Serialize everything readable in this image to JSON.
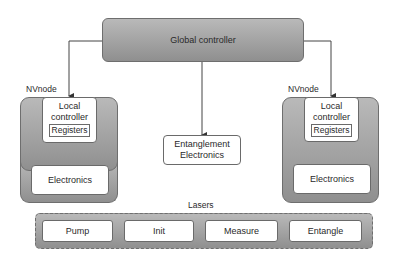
{
  "diagram": {
    "global_controller": {
      "label": "Global controller"
    },
    "nodes": [
      {
        "title": "NVnode",
        "local_controller": "Local\ncontroller",
        "local_controller_line1": "Local",
        "local_controller_line2": "controller",
        "registers": "Registers",
        "electronics": "Electronics"
      },
      {
        "title": "NVnode",
        "local_controller": "Local\ncontroller",
        "local_controller_line1": "Local",
        "local_controller_line2": "controller",
        "registers": "Registers",
        "electronics": "Electronics"
      }
    ],
    "entanglement_electronics": {
      "line1": "Entanglement",
      "line2": "Electronics"
    },
    "lasers": {
      "title": "Lasers",
      "items": [
        "Pump",
        "Init",
        "Measure",
        "Entangle"
      ]
    },
    "colors": {
      "container_fill_top": "#b9b9b9",
      "container_fill_bottom": "#8f8f8f",
      "border": "#6a6a6a",
      "arrow": "#333333"
    }
  }
}
